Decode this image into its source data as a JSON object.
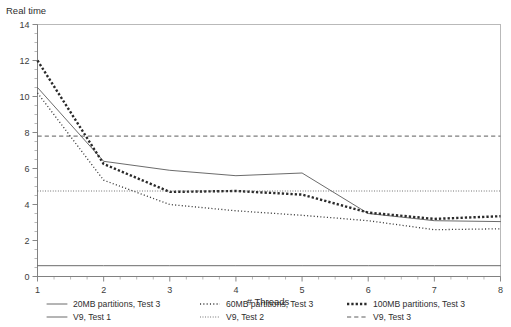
{
  "chart_data": {
    "type": "line",
    "title": "",
    "ylabel": "Real time",
    "xlabel": "# Threads",
    "xlim": [
      1,
      8
    ],
    "ylim": [
      0,
      14
    ],
    "x_ticks": [
      1,
      2,
      3,
      4,
      5,
      6,
      7,
      8
    ],
    "y_ticks": [
      0,
      2,
      4,
      6,
      8,
      10,
      12,
      14
    ],
    "x_minor_step": 0.25,
    "y_minor_step": 0.5,
    "grid": false,
    "legend_position": "bottom",
    "x": [
      1,
      2,
      3,
      4,
      5,
      6,
      7,
      8
    ],
    "series": [
      {
        "name": "20MB partitions, Test 3",
        "style": "solid",
        "width": 0.9,
        "color": "#5a5a5a",
        "values": [
          10.5,
          6.4,
          5.9,
          5.6,
          5.75,
          3.5,
          3.1,
          3.05
        ]
      },
      {
        "name": "60MB partitions, Test 3",
        "style": "dotted-fine",
        "width": 1.3,
        "color": "#3d3d3d",
        "values": [
          10.2,
          5.35,
          4.0,
          3.65,
          3.4,
          3.1,
          2.6,
          2.65
        ]
      },
      {
        "name": "100MB partitions, Test 3",
        "style": "dotted-thick",
        "width": 2.4,
        "color": "#2a2a2a",
        "values": [
          12.0,
          6.25,
          4.7,
          4.75,
          4.55,
          3.55,
          3.2,
          3.35
        ]
      },
      {
        "name": "V9, Test 1",
        "style": "solid",
        "width": 1.0,
        "color": "#6b6b6b",
        "constant": 0.6,
        "values": [
          0.6,
          0.6,
          0.6,
          0.6,
          0.6,
          0.6,
          0.6,
          0.6
        ]
      },
      {
        "name": "V9, Test 2",
        "style": "dotted-fine",
        "width": 1.0,
        "color": "#5c5c5c",
        "constant": 4.75,
        "values": [
          4.75,
          4.75,
          4.75,
          4.75,
          4.75,
          4.75,
          4.75,
          4.75
        ]
      },
      {
        "name": "V9, Test 3",
        "style": "dashed",
        "width": 1.0,
        "color": "#5c5c5c",
        "constant": 7.8,
        "values": [
          7.8,
          7.8,
          7.8,
          7.8,
          7.8,
          7.8,
          7.8,
          7.8
        ]
      }
    ]
  },
  "axes": {
    "y_title": "Real time",
    "x_title": "# Threads",
    "y_tick_labels": [
      "0",
      "2",
      "4",
      "6",
      "8",
      "10",
      "12",
      "14"
    ],
    "x_tick_labels": [
      "1",
      "2",
      "3",
      "4",
      "5",
      "6",
      "7",
      "8"
    ]
  },
  "legend": {
    "entries": [
      {
        "label": "20MB partitions, Test 3",
        "style": "solid"
      },
      {
        "label": "60MB partitions, Test 3",
        "style": "dotted-fine"
      },
      {
        "label": "100MB partitions, Test 3",
        "style": "dotted-thick"
      },
      {
        "label": "V9, Test 1",
        "style": "solid"
      },
      {
        "label": "V9, Test 2",
        "style": "dotted-fine"
      },
      {
        "label": "V9, Test 3",
        "style": "dashed"
      }
    ]
  },
  "colors": {
    "frame": "#b9b9b9",
    "axis": "#7b7b7b",
    "text": "#2e2e2e",
    "background": "#ffffff"
  }
}
